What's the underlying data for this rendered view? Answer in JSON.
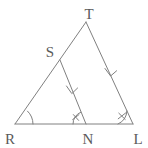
{
  "figure": {
    "kind": "geometry-diagram",
    "background_color": "#ffffff",
    "stroke_color": "#808080",
    "label_color": "#5a5a5a",
    "stroke_width": 1,
    "canvas": {
      "width": 148,
      "height": 148
    }
  },
  "points": {
    "T": {
      "label": "T",
      "x": 86,
      "y": 22,
      "label_x": 89,
      "label_y": 14
    },
    "S": {
      "label": "S",
      "x": 60,
      "y": 60,
      "label_x": 50,
      "label_y": 56
    },
    "R": {
      "label": "R",
      "x": 15,
      "y": 124,
      "label_x": 9,
      "label_y": 143
    },
    "N": {
      "label": "N",
      "x": 86,
      "y": 124,
      "label_x": 89,
      "label_y": 143
    },
    "L": {
      "label": "L",
      "x": 133,
      "y": 124,
      "label_x": 139,
      "label_y": 143
    }
  },
  "segments": [
    {
      "name": "RT",
      "from": "R",
      "to": "T",
      "x1": 15,
      "y1": 124,
      "x2": 86,
      "y2": 22
    },
    {
      "name": "RL",
      "from": "R",
      "to": "L",
      "x1": 15,
      "y1": 124,
      "x2": 133,
      "y2": 124
    },
    {
      "name": "TL",
      "from": "T",
      "to": "L",
      "x1": 86,
      "y1": 22,
      "x2": 133,
      "y2": 124
    },
    {
      "name": "SN",
      "from": "S",
      "to": "N",
      "x1": 60,
      "y1": 60,
      "x2": 86,
      "y2": 124
    }
  ],
  "parallel_marks": [
    {
      "name": "arrow-on-SN",
      "segment": "SN",
      "tick_count": 1,
      "center_x": 72,
      "center_y": 93,
      "angle_deg": 292
    },
    {
      "name": "arrow-on-TL",
      "segment": "TL",
      "tick_count": 1,
      "center_x": 111,
      "center_y": 75,
      "angle_deg": 295
    }
  ],
  "angle_marks": [
    {
      "name": "angle-at-R",
      "vertex": "R",
      "radius": 18,
      "tick_count": 0
    },
    {
      "name": "angle-at-N",
      "vertex": "N",
      "radius": 13,
      "tick_count": 2
    },
    {
      "name": "angle-at-L",
      "vertex": "L",
      "radius": 15,
      "tick_count": 2
    }
  ]
}
